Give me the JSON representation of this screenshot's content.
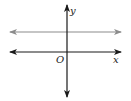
{
  "diagram": {
    "type": "coordinate-plane",
    "axes": {
      "x_label": "x",
      "y_label": "y",
      "origin_label": "O",
      "color": "#1a1a1a"
    },
    "lines": [
      {
        "name": "horizontal-line-above-x-axis",
        "orientation": "horizontal",
        "position": "above x-axis",
        "color": "#8c8c8c"
      }
    ]
  }
}
